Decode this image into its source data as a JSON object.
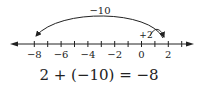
{
  "number_line": {
    "min_tick": -8,
    "max_tick": 3,
    "tick_labels": [
      {
        "value": -8,
        "label": "−8"
      },
      {
        "value": -6,
        "label": "−6"
      },
      {
        "value": -4,
        "label": "−4"
      },
      {
        "value": -2,
        "label": "−2"
      },
      {
        "value": 0,
        "label": "0"
      },
      {
        "value": 2,
        "label": "2"
      }
    ]
  },
  "jumps": [
    {
      "from": 0,
      "to": 2,
      "label": "+2"
    },
    {
      "from": 2,
      "to": -8,
      "label": "−10"
    }
  ],
  "equation": "2 + (−10) = −8",
  "colors": {
    "ink": "#222222",
    "background": "#ffffff"
  }
}
